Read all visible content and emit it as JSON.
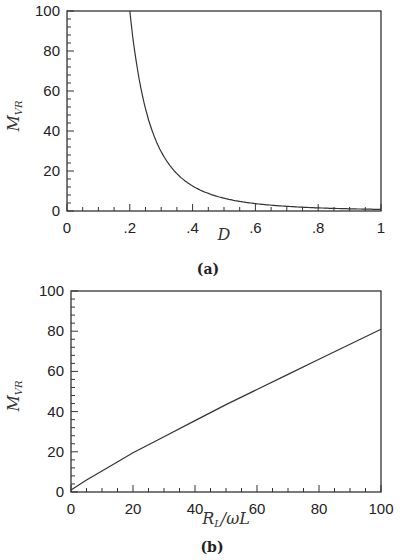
{
  "chart_data": [
    {
      "id": "a",
      "type": "line",
      "caption": "(a)",
      "title": "",
      "xlabel": "D",
      "ylabel": "M_VR",
      "ylabel_main": "M",
      "ylabel_sub": "VR",
      "xlim": [
        0,
        1
      ],
      "ylim": [
        0,
        100
      ],
      "xticks": [
        "0",
        ".2",
        ".4",
        ".6",
        ".8",
        "1"
      ],
      "yticks": [
        "0",
        "20",
        "40",
        "60",
        "80",
        "100"
      ],
      "grid": false,
      "series": [
        {
          "name": "M_VR vs D",
          "x": [
            0.2,
            0.22,
            0.25,
            0.28,
            0.3,
            0.32,
            0.35,
            0.4,
            0.45,
            0.5,
            0.55,
            0.6,
            0.7,
            0.8,
            0.9,
            1.0
          ],
          "y": [
            100,
            75,
            51,
            36,
            29.6,
            24.4,
            18.7,
            12.5,
            8.8,
            6.4,
            4.8,
            3.7,
            2.3,
            1.6,
            1.1,
            0.8
          ]
        }
      ]
    },
    {
      "id": "b",
      "type": "line",
      "caption": "(b)",
      "title": "",
      "xlabel": "R_L/ωL",
      "xlabel_parts": [
        "R",
        "L",
        "/ωL"
      ],
      "ylabel": "M_VR",
      "ylabel_main": "M",
      "ylabel_sub": "VR",
      "xlim": [
        0,
        100
      ],
      "ylim": [
        0,
        100
      ],
      "xticks": [
        "0",
        "20",
        "40",
        "60",
        "80",
        "100"
      ],
      "yticks": [
        "0",
        "20",
        "40",
        "60",
        "80",
        "100"
      ],
      "grid": false,
      "series": [
        {
          "name": "M_VR vs R_L/ωL",
          "x": [
            0,
            2,
            5,
            10,
            20,
            30,
            40,
            50,
            60,
            70,
            80,
            90,
            100
          ],
          "y": [
            1,
            3,
            6,
            10.5,
            19.5,
            27.5,
            35.5,
            43.5,
            51,
            58.5,
            66,
            73.5,
            81
          ]
        }
      ]
    }
  ]
}
